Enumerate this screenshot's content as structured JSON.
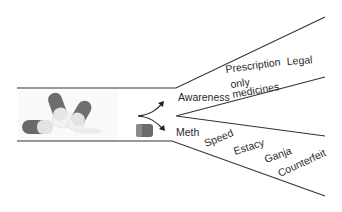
{
  "diagram": {
    "colors": {
      "line": "#333333",
      "text": "#2a2a2a",
      "capsule_dark": "#6a6a6a",
      "capsule_light": "#e8e8e8"
    },
    "left_channel": {
      "description": "image of scattered capsules/pills",
      "icon": "pills-image"
    },
    "split_arrow": {
      "icon": "fork-arrow-icon"
    },
    "single_capsule": {
      "icon": "capsule-icon"
    },
    "upper_branch": {
      "labels": {
        "awareness": "Awareness",
        "prescription": "Prescription",
        "only": "only",
        "medicines": "medicines",
        "legal": "Legal"
      }
    },
    "lower_branch": {
      "labels": {
        "meth": "Meth",
        "speed": "Speed",
        "estacy": "Estacy",
        "ganja": "Ganja",
        "counterfeit": "Counterfeit"
      }
    }
  }
}
